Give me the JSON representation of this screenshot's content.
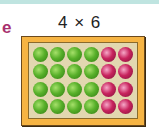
{
  "header": {
    "label": "e",
    "title": "4 × 6"
  },
  "array": {
    "rows": 4,
    "columns": 6,
    "colors": {
      "green": "#58b02a",
      "pink": "#c8245e",
      "frame": "#f6b443",
      "panel": "#e2d7b0"
    },
    "grid": [
      [
        "green",
        "green",
        "green",
        "green",
        "pink",
        "pink"
      ],
      [
        "green",
        "green",
        "green",
        "green",
        "pink",
        "pink"
      ],
      [
        "green",
        "green",
        "green",
        "green",
        "pink",
        "pink"
      ],
      [
        "green",
        "green",
        "green",
        "green",
        "pink",
        "pink"
      ]
    ]
  }
}
